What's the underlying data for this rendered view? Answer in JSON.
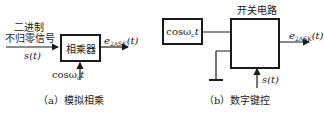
{
  "diagram_a": {
    "input_label_line1": "二进制",
    "input_label_line2": "不归零信号",
    "input_signal": "s(t)",
    "block": "相乘器",
    "carrier": "cosω",
    "carrier_sub": "c",
    "carrier_t": "t",
    "output_e": "e",
    "output_sub": "2ASK",
    "output_t": "(t)",
    "caption": "（a）模拟相乘"
  },
  "diagram_b": {
    "carrier_block": "cosω",
    "carrier_sub": "c",
    "carrier_t": "t",
    "switch_title": "开关电路",
    "output_e": "e",
    "output_sub": "2ASK",
    "output_t": "(t)",
    "control_signal": "s(t)",
    "caption": "（b）数字键控"
  }
}
